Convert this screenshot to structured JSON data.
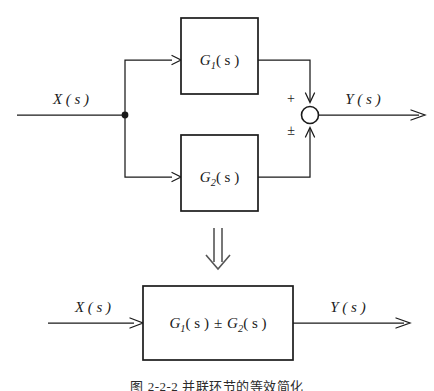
{
  "figure": {
    "background_color": "#ffffff",
    "ink_color": "#1a1a1a",
    "caption": "图 2-2-2 并联环节的等效简化"
  },
  "top_diagram": {
    "input_label": "X ( s )",
    "output_label": "Y ( s )",
    "branch_node_name": "branch-point",
    "blocks": [
      {
        "id": "g1",
        "base": "G",
        "sub": "1",
        "arg": "( s )"
      },
      {
        "id": "g2",
        "base": "G",
        "sub": "2",
        "arg": "( s )"
      }
    ],
    "summing_junction": {
      "sign_top": "+",
      "sign_bottom": "±"
    }
  },
  "transform_arrow": {
    "glyph": "⇓",
    "meaning": "equivalent-to"
  },
  "bottom_diagram": {
    "input_label": "X ( s )",
    "output_label": "Y ( s )",
    "block": {
      "base_1": "G",
      "sub_1": "1",
      "arg_1": "( s )",
      "operator": "±",
      "base_2": "G",
      "sub_2": "2",
      "arg_2": "( s )"
    }
  }
}
